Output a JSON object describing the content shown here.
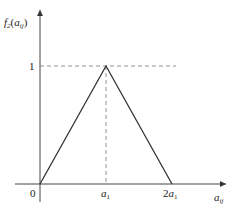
{
  "diagram": {
    "y_axis_label": {
      "base": "f",
      "base_sub": "2",
      "arg": "a",
      "arg_sub": "ij"
    },
    "x_axis_label": {
      "base": "a",
      "sub": "ij"
    },
    "y_tick": "1",
    "x_ticks": [
      {
        "label": "0"
      },
      {
        "label_prefix": "",
        "base": "a",
        "sub": "1"
      },
      {
        "label_prefix": "2",
        "base": "a",
        "sub": "1"
      }
    ],
    "points": [
      {
        "x": 0,
        "y": 0
      },
      {
        "x": 1,
        "y": 1
      },
      {
        "x": 2,
        "y": 0
      }
    ],
    "colors": {
      "line": "#333333",
      "dash": "#777777",
      "axis": "#444444"
    }
  }
}
